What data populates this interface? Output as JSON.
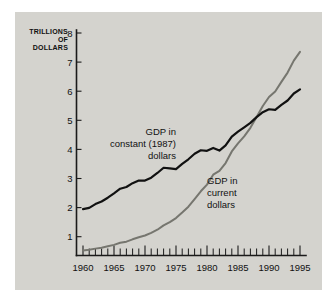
{
  "chart_data": {
    "type": "line",
    "title": "",
    "xlabel": "",
    "ylabel": "TRILLIONS OF DOLLARS",
    "ylabel_lines": [
      "TRILLIONS",
      "OF",
      "DOLLARS"
    ],
    "xlim": [
      1960,
      1995
    ],
    "ylim": [
      0,
      8
    ],
    "grid": false,
    "legend_position": "inline-annotations",
    "y_ticks": [
      1,
      2,
      3,
      4,
      5,
      6,
      7,
      8
    ],
    "y_tick_labels": [
      "1",
      "2",
      "3",
      "4",
      "5",
      "6",
      "7",
      "8"
    ],
    "x_ticks": [
      1960,
      1965,
      1970,
      1975,
      1980,
      1985,
      1990,
      1995
    ],
    "x_tick_labels": [
      "1960",
      "1965",
      "1970",
      "1975",
      "1980",
      "1985",
      "1990",
      "1995"
    ],
    "x_minor_tick_interval": 1,
    "x": [
      1960,
      1961,
      1962,
      1963,
      1964,
      1965,
      1966,
      1967,
      1968,
      1969,
      1970,
      1971,
      1972,
      1973,
      1974,
      1975,
      1976,
      1977,
      1978,
      1979,
      1980,
      1981,
      1982,
      1983,
      1984,
      1985,
      1986,
      1987,
      1988,
      1989,
      1990,
      1991,
      1992,
      1993,
      1994,
      1995
    ],
    "series": [
      {
        "name": "GDP in constant (1987) dollars",
        "label_lines": [
          "GDP in",
          "constant (1987)",
          "dollars"
        ],
        "color": "#111111",
        "values": [
          1.95,
          1.99,
          2.12,
          2.21,
          2.34,
          2.49,
          2.65,
          2.71,
          2.84,
          2.93,
          2.93,
          3.03,
          3.19,
          3.37,
          3.35,
          3.32,
          3.5,
          3.66,
          3.85,
          3.97,
          3.95,
          4.05,
          3.96,
          4.14,
          4.44,
          4.61,
          4.76,
          4.91,
          5.11,
          5.28,
          5.38,
          5.36,
          5.53,
          5.68,
          5.92,
          6.06
        ]
      },
      {
        "name": "GDP in current dollars",
        "label_lines": [
          "GDP in",
          "current",
          "dollars"
        ],
        "color": "#76766f",
        "values": [
          0.53,
          0.55,
          0.59,
          0.62,
          0.67,
          0.72,
          0.79,
          0.83,
          0.91,
          0.98,
          1.04,
          1.13,
          1.24,
          1.39,
          1.5,
          1.64,
          1.83,
          2.03,
          2.29,
          2.56,
          2.79,
          3.13,
          3.26,
          3.53,
          3.93,
          4.21,
          4.45,
          4.74,
          5.11,
          5.49,
          5.8,
          5.99,
          6.32,
          6.64,
          7.05,
          7.35
        ]
      }
    ],
    "annotations": [
      {
        "text": "GDP in constant (1987) dollars",
        "series": 0
      },
      {
        "text": "GDP in current dollars",
        "series": 1
      }
    ]
  },
  "colors": {
    "panel_background": "#d4d3ce",
    "page_background": "#ffffff",
    "axis": "#1a1a1a",
    "constant_dollars_line": "#111111",
    "current_dollars_line": "#76766f"
  }
}
